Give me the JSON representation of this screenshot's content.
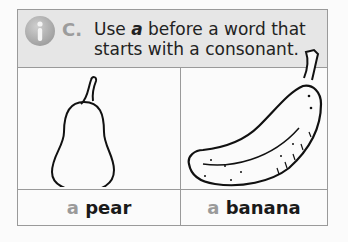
{
  "header": {
    "icon": "info-icon",
    "letter": "C.",
    "rule_prefix": "Use ",
    "rule_article": "a",
    "rule_suffix": " before a word that starts with a consonant."
  },
  "examples": [
    {
      "image": "pear-illustration",
      "article": "a",
      "word": "pear"
    },
    {
      "image": "banana-illustration",
      "article": "a",
      "word": "banana"
    }
  ],
  "colors": {
    "header_bg": "#e6e6e6",
    "border": "#9a9a9a",
    "article_gray": "#9a9a9a",
    "text": "#1a1a1a"
  }
}
